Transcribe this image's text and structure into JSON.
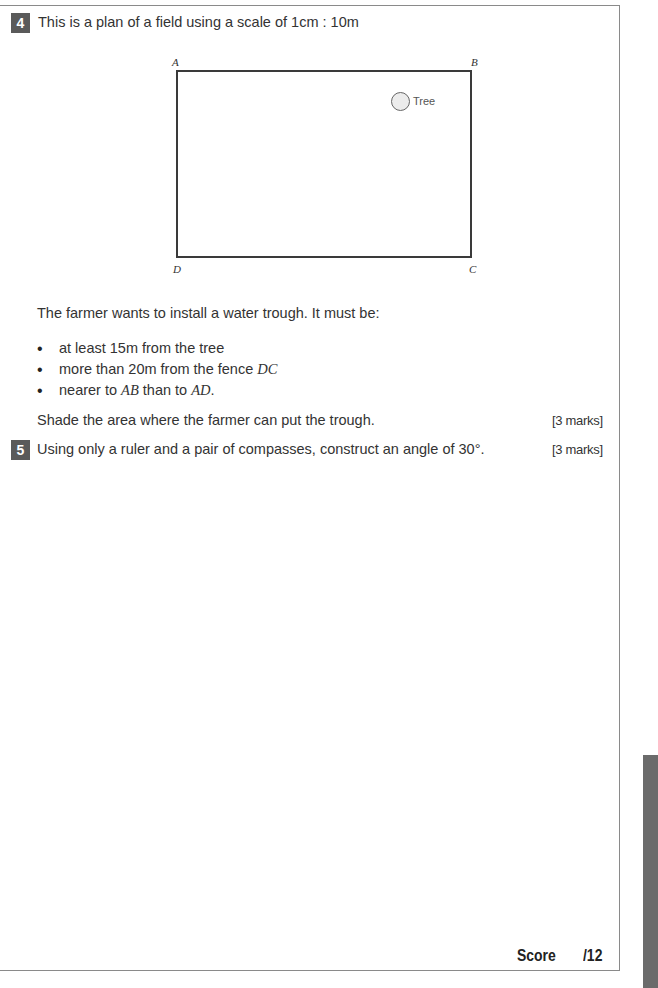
{
  "questions": [
    {
      "number": "4",
      "prompt": "This is a plan of a field using a scale of 1cm : 10m",
      "diagram": {
        "corners": {
          "top_left": "A",
          "top_right": "B",
          "bottom_left": "D",
          "bottom_right": "C"
        },
        "tree_label": "Tree"
      },
      "intro": "The farmer wants to install a water trough. It must be:",
      "conditions": [
        {
          "text": "at least 15m from the tree",
          "math": ""
        },
        {
          "text": "more than 20m from the fence ",
          "math": "DC"
        },
        {
          "text": "nearer to ",
          "math": "AB",
          "text2": " than to ",
          "math2": "AD",
          "text3": "."
        }
      ],
      "instruction": "Shade the area where the farmer can put the trough.",
      "marks": "[3 marks]"
    },
    {
      "number": "5",
      "prompt": "Using only a ruler and a pair of compasses, construct an angle of 30°.",
      "marks": "[3 marks]"
    }
  ],
  "score": {
    "label": "Score",
    "total": "/12"
  },
  "footer": "Revision Guide – pages 66–67"
}
